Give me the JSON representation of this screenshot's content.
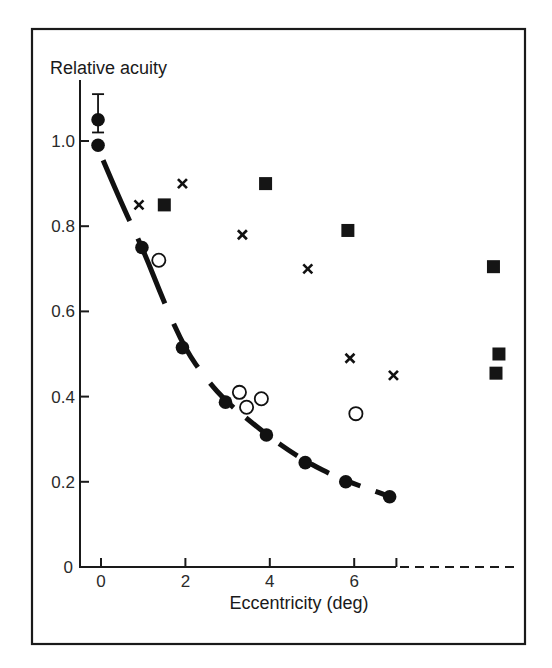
{
  "chart_data": {
    "type": "scatter",
    "title": "",
    "xlabel": "Eccentricity (deg)",
    "ylabel": "Relative acuity",
    "xlim": [
      -0.5,
      7
    ],
    "ylim": [
      0,
      1.1
    ],
    "x_ticks": [
      0,
      2,
      4,
      6,
      7
    ],
    "x_tick_labels": [
      "0",
      "2",
      "4",
      "6",
      ""
    ],
    "y_ticks": [
      0,
      0.2,
      0.4,
      0.6,
      0.8,
      1.0
    ],
    "y_tick_labels": [
      "0",
      "0.2",
      "0.4",
      "0.6",
      "0.8",
      "1.0"
    ],
    "grid": false,
    "legend": null,
    "x_axis_extension": "dashed beyond 7 deg (far periphery)",
    "series": [
      {
        "name": "filled-circles",
        "marker": "filled-circle",
        "points": [
          {
            "x": -0.07,
            "y": 1.05,
            "err_low": 1.02,
            "err_high": 1.11
          },
          {
            "x": -0.07,
            "y": 0.99
          },
          {
            "x": 0.97,
            "y": 0.75
          },
          {
            "x": 1.93,
            "y": 0.515
          },
          {
            "x": 2.95,
            "y": 0.387
          },
          {
            "x": 3.92,
            "y": 0.31
          },
          {
            "x": 4.84,
            "y": 0.245
          },
          {
            "x": 5.8,
            "y": 0.2
          },
          {
            "x": 6.84,
            "y": 0.165
          }
        ]
      },
      {
        "name": "open-circles",
        "marker": "open-circle",
        "points": [
          {
            "x": 1.37,
            "y": 0.72
          },
          {
            "x": 3.28,
            "y": 0.41
          },
          {
            "x": 3.45,
            "y": 0.375
          },
          {
            "x": 3.8,
            "y": 0.395
          },
          {
            "x": 6.04,
            "y": 0.36
          }
        ]
      },
      {
        "name": "crosses",
        "marker": "cross",
        "points": [
          {
            "x": 0.9,
            "y": 0.85
          },
          {
            "x": 1.93,
            "y": 0.9
          },
          {
            "x": 3.35,
            "y": 0.78
          },
          {
            "x": 4.9,
            "y": 0.7
          },
          {
            "x": 5.9,
            "y": 0.49
          },
          {
            "x": 6.93,
            "y": 0.45
          }
        ]
      },
      {
        "name": "filled-squares",
        "marker": "filled-square",
        "points": [
          {
            "x": 1.5,
            "y": 0.85
          },
          {
            "x": 3.9,
            "y": 0.9
          },
          {
            "x": 5.85,
            "y": 0.79
          },
          {
            "x": 9.3,
            "y": 0.705
          },
          {
            "x": 9.43,
            "y": 0.5
          },
          {
            "x": 9.36,
            "y": 0.455
          }
        ]
      }
    ],
    "fit_curve": {
      "style": "thick dashed",
      "points": [
        {
          "x": 0.05,
          "y": 0.955
        },
        {
          "x": 0.5,
          "y": 0.85
        },
        {
          "x": 1.0,
          "y": 0.745
        },
        {
          "x": 1.5,
          "y": 0.62
        },
        {
          "x": 2.0,
          "y": 0.51
        },
        {
          "x": 2.5,
          "y": 0.44
        },
        {
          "x": 3.0,
          "y": 0.385
        },
        {
          "x": 3.5,
          "y": 0.345
        },
        {
          "x": 4.0,
          "y": 0.305
        },
        {
          "x": 4.5,
          "y": 0.27
        },
        {
          "x": 5.0,
          "y": 0.24
        },
        {
          "x": 5.5,
          "y": 0.215
        },
        {
          "x": 6.0,
          "y": 0.195
        },
        {
          "x": 6.5,
          "y": 0.178
        },
        {
          "x": 6.84,
          "y": 0.165
        }
      ]
    }
  },
  "labels": {
    "ylabel": "Relative acuity",
    "xlabel": "Eccentricity (deg)"
  }
}
